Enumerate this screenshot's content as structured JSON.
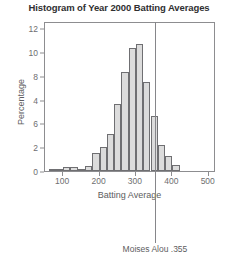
{
  "chart_data": {
    "type": "bar",
    "title": "Histogram of Year 2000 Batting Averages",
    "xlabel": "Batting Average",
    "ylabel": "Percentage",
    "xlim": [
      50,
      520
    ],
    "ylim": [
      0,
      12.6
    ],
    "grid": false,
    "legend": null,
    "bin_width": 20,
    "x_ticks": [
      {
        "value": 100,
        "label": "100"
      },
      {
        "value": 200,
        "label": "200"
      },
      {
        "value": 300,
        "label": "300"
      },
      {
        "value": 400,
        "label": "400"
      },
      {
        "value": 500,
        "label": "500"
      }
    ],
    "y_ticks": [
      {
        "value": 0,
        "label": "0"
      },
      {
        "value": 2,
        "label": "2"
      },
      {
        "value": 4,
        "label": "6"
      },
      {
        "value": 6,
        "label": "4"
      },
      {
        "value": 8,
        "label": "8"
      },
      {
        "value": 10,
        "label": "10"
      },
      {
        "value": 12,
        "label": "12"
      }
    ],
    "bins": [
      {
        "start": 60,
        "end": 80,
        "value": 0.2
      },
      {
        "start": 80,
        "end": 100,
        "value": 0.2
      },
      {
        "start": 100,
        "end": 120,
        "value": 0.3
      },
      {
        "start": 120,
        "end": 140,
        "value": 0.3
      },
      {
        "start": 140,
        "end": 160,
        "value": 0.2
      },
      {
        "start": 160,
        "end": 180,
        "value": 0.4
      },
      {
        "start": 180,
        "end": 200,
        "value": 1.5
      },
      {
        "start": 200,
        "end": 220,
        "value": 2.0
      },
      {
        "start": 220,
        "end": 240,
        "value": 3.1
      },
      {
        "start": 240,
        "end": 260,
        "value": 5.6
      },
      {
        "start": 260,
        "end": 280,
        "value": 8.3
      },
      {
        "start": 280,
        "end": 300,
        "value": 10.3
      },
      {
        "start": 300,
        "end": 320,
        "value": 10.7
      },
      {
        "start": 320,
        "end": 340,
        "value": 7.5
      },
      {
        "start": 340,
        "end": 360,
        "value": 4.6
      },
      {
        "start": 360,
        "end": 380,
        "value": 2.2
      },
      {
        "start": 380,
        "end": 400,
        "value": 1.3
      },
      {
        "start": 400,
        "end": 420,
        "value": 0.5
      }
    ],
    "annotations": [
      {
        "label": "Moises Alou .355",
        "x_value": 355
      }
    ]
  }
}
